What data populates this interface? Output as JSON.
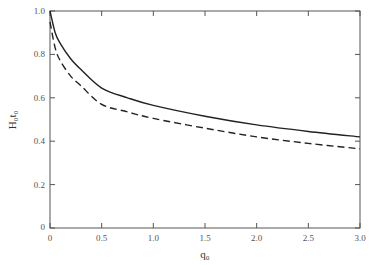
{
  "chart_data": {
    "type": "line",
    "title": "",
    "xlabel": "q₀",
    "ylabel": "H₀t₀",
    "xlim": [
      0,
      3.0
    ],
    "ylim": [
      0,
      1.0
    ],
    "grid": false,
    "legend": "none",
    "x_ticks": [
      "0",
      "0.5",
      "1.0",
      "1.5",
      "2.0",
      "2.5",
      "3.0"
    ],
    "y_ticks": [
      "0",
      "0.2",
      "0.4",
      "0.6",
      "0.8",
      "1.0"
    ],
    "x": [
      0,
      0.05,
      0.1,
      0.2,
      0.3,
      0.5,
      0.75,
      1.0,
      1.5,
      2.0,
      2.5,
      3.0
    ],
    "series": [
      {
        "name": "solid",
        "style": "solid",
        "values": [
          1.0,
          0.9,
          0.85,
          0.78,
          0.73,
          0.645,
          0.6,
          0.565,
          0.515,
          0.475,
          0.445,
          0.42
        ]
      },
      {
        "name": "dashed",
        "style": "dashed",
        "values": [
          0.95,
          0.83,
          0.77,
          0.7,
          0.655,
          0.57,
          0.535,
          0.505,
          0.46,
          0.42,
          0.39,
          0.365
        ]
      }
    ]
  }
}
